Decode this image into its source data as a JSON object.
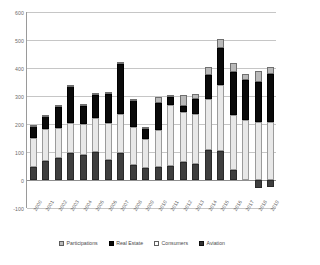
{
  "chart_data": {
    "type": "bar",
    "stacked": true,
    "title": "",
    "subtitle": "",
    "xlabel": "",
    "ylabel": "",
    "ylim": [
      -100,
      600
    ],
    "yticks": [
      600,
      500,
      400,
      300,
      200,
      100,
      0,
      -100
    ],
    "ytick_labels": [
      "600",
      "500",
      "400",
      "300",
      "200",
      "100",
      "0",
      "-100"
    ],
    "grid": true,
    "legend_position": "bottom",
    "categories": [
      "2000",
      "2001",
      "2002",
      "2003",
      "2004",
      "2005",
      "2006",
      "2007",
      "2008",
      "2009",
      "2010",
      "2011",
      "2012",
      "2013",
      "2014",
      "2015",
      "2016",
      "2017",
      "2018",
      "2019"
    ],
    "series": [
      {
        "name": "Aviation",
        "color": "#3f3f3f",
        "values": [
          47,
          68,
          77,
          97,
          88,
          100,
          72,
          96,
          53,
          44,
          45,
          50,
          64,
          57,
          108,
          104,
          37,
          0,
          -28,
          -26
        ]
      },
      {
        "name": "Consumers",
        "color": "#e8e8e8",
        "values": [
          103,
          114,
          107,
          107,
          111,
          122,
          132,
          141,
          136,
          102,
          133,
          219,
          178,
          180,
          183,
          237,
          195,
          215,
          208,
          208
        ]
      },
      {
        "name": "Real Estate",
        "color": "#0a0a0a",
        "values": [
          43,
          47,
          77,
          133,
          67,
          83,
          103,
          176,
          96,
          38,
          98,
          28,
          24,
          52,
          83,
          130,
          152,
          141,
          141,
          172
        ]
      },
      {
        "name": "Participations",
        "color": "#b9b9b9",
        "values": [
          3,
          4,
          8,
          4,
          4,
          5,
          6,
          7,
          6,
          5,
          22,
          7,
          36,
          17,
          30,
          32,
          35,
          22,
          42,
          25
        ]
      }
    ],
    "totals": [
      196,
      233,
      269,
      341,
      270,
      310,
      313,
      420,
      291,
      189,
      298,
      304,
      302,
      306,
      404,
      503,
      419,
      378,
      391,
      405
    ]
  },
  "legend": {
    "items": [
      {
        "label": "Participations",
        "swatch": "participations-swatch"
      },
      {
        "label": "Real Estate",
        "swatch": "real-estate-swatch"
      },
      {
        "label": "Consumers",
        "swatch": "consumers-swatch"
      },
      {
        "label": "Aviation",
        "swatch": "aviation-swatch"
      }
    ]
  }
}
